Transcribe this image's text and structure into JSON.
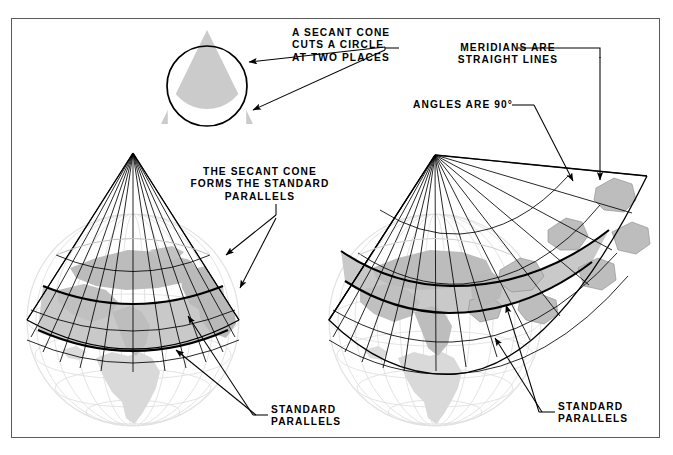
{
  "figure": {
    "border_color": "#5a5a5a",
    "land_fill": "#b8b8b8",
    "band_fill": "#c9c9c9",
    "line_color": "#000000",
    "faded_line_color": "#d8d8d8"
  },
  "labels": {
    "secant_cone": "A SECANT CONE\nCUTS A CIRCLE\nAT TWO PLACES",
    "meridians": "MERIDIANS ARE\nSTRAIGHT LINES",
    "angles": "ANGLES ARE 90°",
    "secant_forms": "THE SECANT CONE\nFORMS THE STANDARD\nPARALLELS",
    "standard_parallels_left": "STANDARD\nPARALLELS",
    "standard_parallels_right": "STANDARD\nPARALLELS"
  },
  "diagram_data": {
    "type": "diagram",
    "panels": [
      {
        "name": "cone-circle-cross-section",
        "description": "Triangle (cone cross-section) overlapping a circle (globe cross-section), intersecting at two places",
        "circle_center": [
          207,
          86
        ],
        "circle_radius": 40,
        "triangle_apex": [
          207,
          30
        ],
        "triangle_base_y": 124
      },
      {
        "name": "secant-cone-on-globe",
        "description": "Cone placed over a globe, cutting it at two standard parallels",
        "apex": [
          133,
          153
        ],
        "globe_center": [
          133,
          320
        ],
        "globe_radius": 106
      },
      {
        "name": "cone-unrolled",
        "description": "Secant cone partially unrolled into a flat fan showing straight meridians and 90 degree angles",
        "apex": [
          435,
          155
        ],
        "globe_center": [
          435,
          320
        ],
        "globe_radius": 106
      }
    ],
    "standard_parallel_count": 2,
    "meridian_count": 13,
    "parallel_count": 5
  }
}
